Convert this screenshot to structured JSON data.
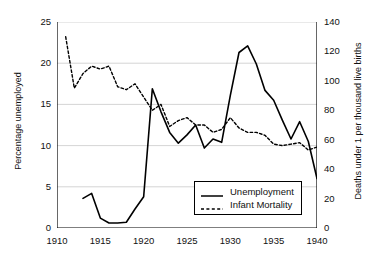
{
  "chart_data": {
    "type": "line",
    "title": "",
    "xlabel": "",
    "ylabel": "Percentage unemployed",
    "y2label": "Deaths under 1 per thousand live births",
    "xlim": [
      1910,
      1940
    ],
    "ylim": [
      0,
      25
    ],
    "y2lim": [
      0,
      140
    ],
    "xticks": [
      1910,
      1915,
      1920,
      1925,
      1930,
      1935,
      1940
    ],
    "yticks": [
      0,
      5,
      10,
      15,
      20,
      25
    ],
    "y2ticks": [
      0,
      20,
      40,
      60,
      80,
      100,
      120,
      140
    ],
    "grid": "horizontal",
    "legend_position": "lower-center-right",
    "series": [
      {
        "name": "Unemployment",
        "axis": "left",
        "style": "solid",
        "color": "#000000",
        "x": [
          1913,
          1914,
          1915,
          1916,
          1917,
          1918,
          1919,
          1920,
          1921,
          1922,
          1923,
          1924,
          1925,
          1926,
          1927,
          1928,
          1929,
          1930,
          1931,
          1932,
          1933,
          1934,
          1935,
          1936,
          1937,
          1938,
          1939,
          1940
        ],
        "values": [
          3.6,
          4.2,
          1.2,
          0.6,
          0.6,
          0.7,
          2.3,
          3.8,
          16.9,
          14.1,
          11.6,
          10.3,
          11.3,
          12.5,
          9.7,
          10.8,
          10.4,
          16.1,
          21.3,
          22.1,
          19.9,
          16.7,
          15.5,
          13.1,
          10.8,
          12.9,
          10.5,
          6.0
        ]
      },
      {
        "name": "Infant Mortality",
        "axis": "right",
        "style": "dashed",
        "color": "#000000",
        "x": [
          1911,
          1912,
          1913,
          1914,
          1915,
          1916,
          1917,
          1918,
          1919,
          1920,
          1921,
          1922,
          1923,
          1924,
          1925,
          1926,
          1927,
          1928,
          1929,
          1930,
          1931,
          1932,
          1933,
          1934,
          1935,
          1936,
          1937,
          1938,
          1939,
          1940
        ],
        "values": [
          130,
          95,
          105,
          110,
          108,
          110,
          96,
          94,
          98,
          89,
          80,
          84,
          69,
          73,
          75,
          70,
          70,
          65,
          67,
          75,
          68,
          65,
          65,
          63,
          57,
          56,
          57,
          58,
          53,
          55
        ]
      }
    ]
  },
  "axes": {
    "left": {
      "title": "Percentage unemployed",
      "ticks": [
        "0",
        "5",
        "10",
        "15",
        "20",
        "25"
      ]
    },
    "right": {
      "title": "Deaths under 1 per thousand live births",
      "ticks": [
        "0",
        "20",
        "40",
        "60",
        "80",
        "100",
        "120",
        "140"
      ]
    },
    "bottom": {
      "ticks": [
        "1910",
        "1915",
        "1920",
        "1925",
        "1930",
        "1935",
        "1940"
      ]
    }
  },
  "legend": {
    "items": [
      {
        "label": "Unemployment",
        "style": "solid"
      },
      {
        "label": "Infant Mortality",
        "style": "dashed"
      }
    ]
  }
}
